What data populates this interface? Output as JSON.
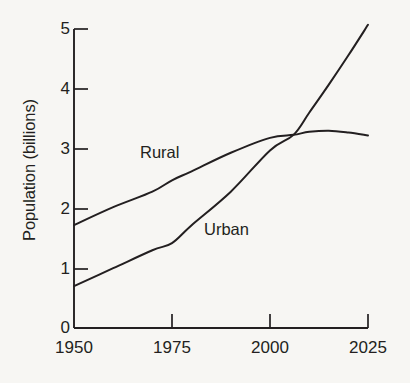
{
  "chart_data": {
    "type": "line",
    "title": "",
    "xlabel": "",
    "ylabel": "Population (billions)",
    "xlim": [
      1950,
      2025
    ],
    "ylim": [
      0,
      5
    ],
    "xticks": [
      "1950",
      "1975",
      "2000",
      "2025"
    ],
    "xtick_values": [
      1950,
      1975,
      2000,
      2025
    ],
    "yticks": [
      "0",
      "1",
      "2",
      "3",
      "4",
      "5"
    ],
    "ytick_values": [
      0,
      1,
      2,
      3,
      4,
      5
    ],
    "grid": false,
    "legend": "inline-labels",
    "x": [
      1950,
      1960,
      1970,
      1975,
      1980,
      1990,
      2000,
      2006,
      2010,
      2015,
      2020,
      2025
    ],
    "series": [
      {
        "name": "Rural",
        "label": "Rural",
        "color": "#231f20",
        "values": [
          1.72,
          2.02,
          2.28,
          2.47,
          2.62,
          2.93,
          3.18,
          3.23,
          3.28,
          3.3,
          3.27,
          3.22
        ]
      },
      {
        "name": "Urban",
        "label": "Urban",
        "color": "#231f20",
        "values": [
          0.7,
          1.0,
          1.3,
          1.42,
          1.72,
          2.28,
          2.97,
          3.23,
          3.6,
          4.07,
          4.56,
          5.07
        ]
      }
    ],
    "annotations": [
      {
        "text": "Rural",
        "x": 1967,
        "y": 3.08
      },
      {
        "text": "Urban",
        "x": 1983,
        "y": 1.82
      }
    ]
  },
  "axis": {
    "y_title": "Population (billions)"
  }
}
